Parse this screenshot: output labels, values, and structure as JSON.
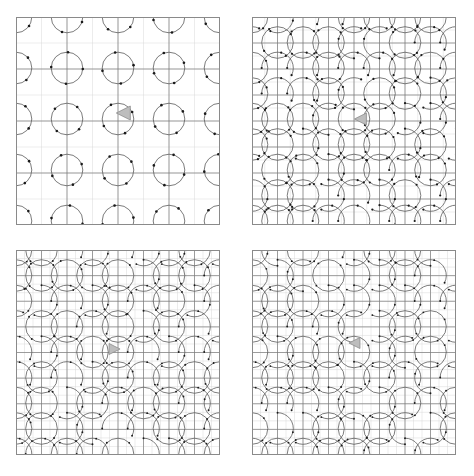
{
  "figure": {
    "title": "",
    "background_color": "#ffffff",
    "width": 474,
    "height": 476,
    "layout": "2x2-grid-of-panels",
    "panel_count": 4
  },
  "style": {
    "minor_grid_color": "#d8d8d8",
    "major_grid_color": "#7a7a7a",
    "panel_border_color": "#8a8a8a",
    "curve_color": "#5a5a5a",
    "dot_color": "#1a1a1a",
    "cursor_fill": "#bdbdbd",
    "cursor_stroke": "#8c8c8c"
  },
  "chart_data": {
    "type": "scatter",
    "xlabel": "",
    "ylabel": "",
    "grid": true,
    "legend": null,
    "panels": [
      {
        "index": 0,
        "position": "top-left",
        "label": "",
        "x": 16,
        "y": 17,
        "width": 204,
        "height": 208,
        "minor_divisions": 8,
        "major_every": 2,
        "cells": 8,
        "cell_px": 25.5,
        "circle_radius_cells": 0.62,
        "pattern": "circles",
        "dots_per_circle": 4,
        "dot_radius_px": 1.3,
        "cursor": {
          "x": 124,
          "y": 113,
          "size": 14,
          "direction": "left"
        },
        "xlim": [
          0,
          8
        ],
        "ylim": [
          0,
          8
        ]
      },
      {
        "index": 1,
        "position": "top-right",
        "label": "",
        "x": 252,
        "y": 17,
        "width": 204,
        "height": 208,
        "minor_divisions": 16,
        "major_every": 2,
        "cells": 16,
        "cell_px": 12.75,
        "circle_radius_cells": 1.24,
        "pattern": "circles-and-serpentine-arcs",
        "dots_per_circle": 4,
        "dot_radius_px": 1.1,
        "cursor": {
          "x": 361,
          "y": 119,
          "size": 12,
          "direction": "left"
        },
        "xlim": [
          0,
          16
        ],
        "ylim": [
          0,
          16
        ]
      },
      {
        "index": 2,
        "position": "bottom-left",
        "label": "",
        "x": 16,
        "y": 250,
        "width": 204,
        "height": 205,
        "minor_divisions": 24,
        "major_every": 3,
        "cells": 24,
        "cell_px": 8.5,
        "circle_radius_cells": 1.86,
        "pattern": "circles-and-serpentine-arcs",
        "dots_per_circle": 4,
        "dot_radius_px": 0.95,
        "cursor": {
          "x": 114,
          "y": 349,
          "size": 11,
          "direction": "right"
        },
        "xlim": [
          0,
          24
        ],
        "ylim": [
          0,
          24
        ]
      },
      {
        "index": 3,
        "position": "bottom-right",
        "label": "",
        "x": 252,
        "y": 250,
        "width": 204,
        "height": 205,
        "minor_divisions": 24,
        "major_every": 3,
        "cells": 24,
        "cell_px": 8.5,
        "circle_radius_cells": 1.86,
        "pattern": "circles-and-serpentine-arcs",
        "dots_per_circle": 4,
        "dot_radius_px": 0.95,
        "cursor": {
          "x": 355,
          "y": 343,
          "size": 11,
          "direction": "left"
        },
        "xlim": [
          0,
          24
        ],
        "ylim": [
          0,
          24
        ]
      }
    ]
  }
}
